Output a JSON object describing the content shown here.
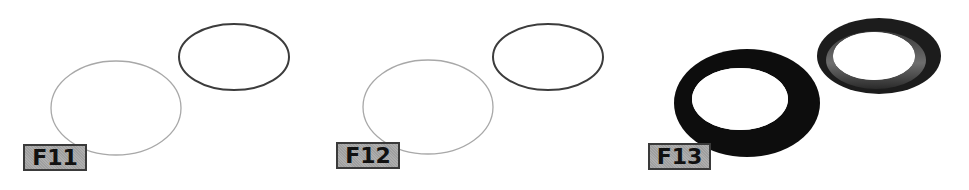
{
  "figure": {
    "panels": [
      {
        "label": "F11",
        "description": "Two thin-outline ellipses; back ellipse drawn with darker stroke, front ellipse drawn with light gray stroke",
        "back_shape": {
          "type": "ellipse-outline",
          "stroke": "#3c3c3c"
        },
        "front_shape": {
          "type": "ellipse-outline",
          "stroke": "#a8a8a8"
        }
      },
      {
        "label": "F12",
        "description": "Two thin-outline ellipses; back ellipse drawn with darker stroke, front ellipse drawn with light gray stroke",
        "back_shape": {
          "type": "ellipse-outline",
          "stroke": "#3c3c3c"
        },
        "front_shape": {
          "type": "ellipse-outline",
          "stroke": "#a8a8a8"
        }
      },
      {
        "label": "F13",
        "description": "Two rings with thickness; front ring is a solid thick black flat ring, back ring is a conical/beveled ring with gray inner band",
        "back_shape": {
          "type": "beveled-ring",
          "fill": "#1e1e1e",
          "inner_band": "#6a6a6a"
        },
        "front_shape": {
          "type": "thick-ring",
          "fill": "#0d0d0d"
        }
      }
    ],
    "colors": {
      "background": "#ffffff",
      "label_bg": "#a9a9a9",
      "label_border": "#3a3a3a",
      "label_text": "#111111"
    }
  }
}
